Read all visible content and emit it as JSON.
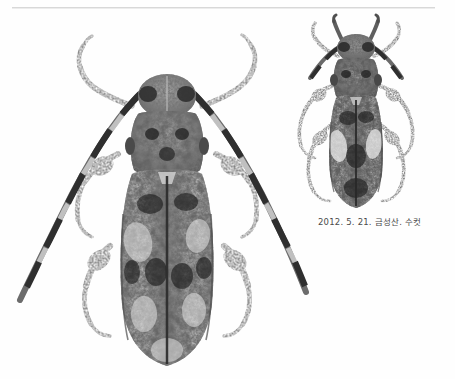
{
  "plate": {
    "background_color": "#ffffff",
    "rule_color": "#d8d8d8",
    "ink_color": "#3a3a3a"
  },
  "caption": {
    "text": "2012. 5. 21. 금성산. 수컷",
    "color": "#4a4a4a"
  },
  "specimens": [
    {
      "name": "large-beetle",
      "view": "dorsal",
      "position": "left",
      "description": "mottled grey-black longhorn beetle, dorsal view, long banded antennae"
    },
    {
      "name": "small-beetle",
      "view": "dorsal",
      "position": "upper-right",
      "description": "smaller longhorn beetle, dorsal view, pale patches on elytra"
    }
  ],
  "icons": {
    "beetle": "beetle-icon"
  }
}
